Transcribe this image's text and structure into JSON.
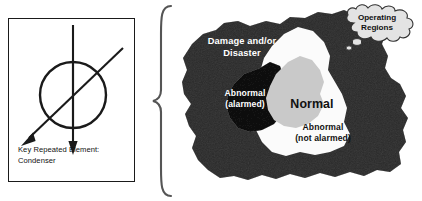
{
  "figure": {
    "width": 201,
    "height": 201,
    "background_color": "#ffffff"
  },
  "key_panel": {
    "name": "key-repeated-element-box",
    "caption_line_1": "Key Repeated Element:",
    "caption_line_2": "Condenser",
    "symbol": {
      "shape": "circle-with-vertical-arrow-and-diagonal-arrow",
      "circle_name": "condenser-circle",
      "vertical_arrow_name": "vertical-flow-arrow-down",
      "diagonal_arrow_name": "diagonal-flow-arrow-down-left",
      "stroke_color": "#1a1a1a"
    },
    "border_color": "#1a1a1a"
  },
  "brace": {
    "name": "grouping-brace",
    "glyph": "{",
    "color": "#555555"
  },
  "blob": {
    "name": "operating-regions-blob",
    "regions": [
      {
        "id": "damage",
        "label_line_1": "Damage and/or",
        "label_line_2": "Disaster",
        "fill_color": "#6e6e6e",
        "text_color": "#ffffff"
      },
      {
        "id": "abnormal-alarmed",
        "label_line_1": "Abnormal",
        "label_line_2": "(alarmed)",
        "fill_color": "#3b3b3b",
        "text_color": "#ffffff"
      },
      {
        "id": "abnormal-not-alarmed",
        "label_line_1": "Abnormal",
        "label_line_2": "(not alarmed)",
        "fill_color": "#fbfbfb",
        "text_color": "#111111"
      },
      {
        "id": "normal",
        "label_line_1": "Normal",
        "fill_color": "#c9c9c9",
        "text_color": "#111111"
      }
    ]
  },
  "callout": {
    "name": "operating-regions-thought-cloud",
    "label_line_1": "Operating",
    "label_line_2": "Regions",
    "fill_color": "#e3e3e3",
    "outline_color": "#333333"
  }
}
